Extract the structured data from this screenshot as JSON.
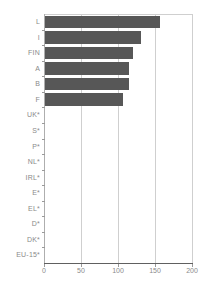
{
  "chart_data": {
    "type": "bar",
    "orientation": "horizontal",
    "title": "",
    "xlabel": "",
    "ylabel": "",
    "categories": [
      "L",
      "I",
      "FIN",
      "A",
      "B",
      "F",
      "UK*",
      "S*",
      "P*",
      "NL*",
      "IRL*",
      "E*",
      "EL*",
      "D*",
      "DK*",
      "EU-15*"
    ],
    "values": [
      155,
      129,
      119,
      113,
      113,
      106,
      null,
      null,
      null,
      null,
      null,
      null,
      null,
      null,
      null,
      null
    ],
    "xlim": [
      0,
      200
    ],
    "xticks": [
      0,
      50,
      100,
      150,
      200
    ],
    "grid": true,
    "legend": false
  },
  "colors": {
    "background": "#ffffff",
    "bar": "#575757",
    "gridline": "#cfcfcf",
    "plot_border": "#cfcfcf",
    "axis_left": "#aeaeae",
    "axis_bottom": "#606060",
    "tick_mark": "#9a9a9a",
    "label_text": "#8a8a8a"
  }
}
